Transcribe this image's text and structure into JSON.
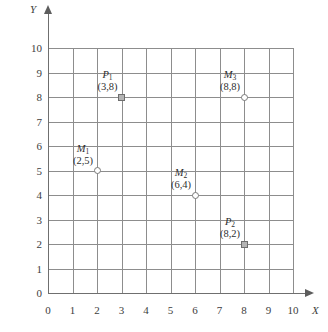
{
  "chart_data": {
    "type": "scatter",
    "title": "",
    "xlabel": "X",
    "ylabel": "Y",
    "xlim": [
      0,
      10
    ],
    "ylim": [
      0,
      10
    ],
    "grid": true,
    "legend": "none",
    "x_ticks": [
      "0",
      "1",
      "2",
      "3",
      "4",
      "5",
      "6",
      "7",
      "8",
      "9",
      "10"
    ],
    "y_ticks": [
      "0",
      "1",
      "2",
      "3",
      "4",
      "5",
      "6",
      "7",
      "8",
      "9",
      "10"
    ],
    "points": [
      {
        "name": "P",
        "sub": "1",
        "label": "P1",
        "coords": "(3,8)",
        "x": 3,
        "y": 8,
        "marker": "square"
      },
      {
        "name": "M",
        "sub": "3",
        "label": "M3",
        "coords": "(8,8)",
        "x": 8,
        "y": 8,
        "marker": "circle"
      },
      {
        "name": "M",
        "sub": "1",
        "label": "M1",
        "coords": "(2,5)",
        "x": 2,
        "y": 5,
        "marker": "circle"
      },
      {
        "name": "M",
        "sub": "2",
        "label": "M2",
        "coords": "(6,4)",
        "x": 6,
        "y": 4,
        "marker": "circle"
      },
      {
        "name": "P",
        "sub": "2",
        "label": "P2",
        "coords": "(8,2)",
        "x": 8,
        "y": 2,
        "marker": "square"
      }
    ],
    "colors": {
      "gridline": "#8d8d8d",
      "axis": "#6f6f6f",
      "text": "#2f2f2f",
      "marker_fill": "#b4b4b4",
      "marker_stroke": "#6e6e6e"
    }
  }
}
